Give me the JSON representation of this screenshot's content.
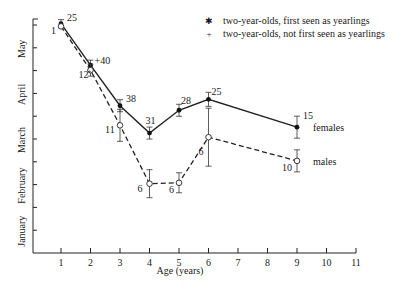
{
  "chart_data": {
    "type": "line",
    "title": "",
    "xlabel": "Age (years)",
    "ylabel": "",
    "xlim": [
      0,
      11
    ],
    "x_ticks": [
      1,
      2,
      3,
      4,
      5,
      6,
      7,
      8,
      9,
      10,
      11
    ],
    "y_month_labels": [
      "January",
      "February",
      "March",
      "April",
      "May"
    ],
    "legend": [
      {
        "marker": "filled-star",
        "label": "two-year-olds, first seen as yearlings"
      },
      {
        "marker": "plus",
        "label": "two-year-olds, not first seen as yearlings"
      }
    ],
    "series": [
      {
        "name": "females",
        "style": "solid",
        "marker": "filled-circle",
        "x": [
          1,
          2,
          3,
          4,
          5,
          6,
          9
        ],
        "y_month_position": [
          5.53,
          4.62,
          3.73,
          3.13,
          3.63,
          3.87,
          3.26
        ],
        "n": [
          "25",
          "+40",
          "38",
          "31",
          "28",
          "25",
          "15"
        ]
      },
      {
        "name": "males",
        "style": "dashed",
        "marker": "open-circle",
        "x": [
          1,
          2,
          3,
          4,
          5,
          6,
          9
        ],
        "y_month_position": [
          5.47,
          4.51,
          3.3,
          2.02,
          2.04,
          3.04,
          2.52
        ],
        "n": [
          "1",
          "12",
          "11",
          "6",
          "6",
          "6",
          "10"
        ]
      }
    ],
    "series_labels": {
      "females": "females",
      "males": "males"
    }
  }
}
